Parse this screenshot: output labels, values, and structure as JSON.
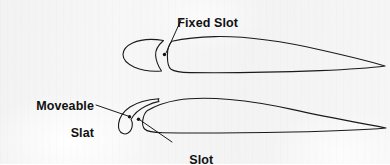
{
  "figure": {
    "background_color": "#f4f4f4",
    "ink_color": "#1a1a1a",
    "text_color": "#111111"
  },
  "labels": {
    "fixed_slot": "Fixed Slot",
    "moveable_slat_line1": "Moveable",
    "moveable_slat_line2": "Slat",
    "slot": "Slot"
  },
  "callouts": [
    {
      "name": "fixed-slot",
      "text": "Fixed Slot",
      "leader_from": [
        181,
        20
      ],
      "leader_to": [
        166,
        53
      ],
      "marker": [
        164,
        55
      ]
    },
    {
      "name": "moveable-slat",
      "text": "Moveable Slat",
      "leader_from": [
        96,
        105
      ],
      "leader_to": [
        128,
        116
      ],
      "marker": [
        130,
        117
      ]
    },
    {
      "name": "slot",
      "text": "Slot",
      "leader_from": [
        172,
        142
      ],
      "leader_to": [
        140,
        120
      ],
      "marker": [
        138,
        119
      ]
    }
  ],
  "diagrams": [
    {
      "name": "fixed-slot-airfoil",
      "description": "Upper airfoil with a fixed leading-edge slot formed by a separate forward wedge element",
      "chord_extent_px": [
        123,
        385
      ],
      "vertical_extent_px": [
        36,
        76
      ],
      "trailing_edge_px": [
        385,
        66
      ]
    },
    {
      "name": "moveable-slat-airfoil",
      "description": "Lower airfoil with an extended moveable slat forming a slot ahead of the leading edge",
      "chord_extent_px": [
        118,
        386
      ],
      "vertical_extent_px": [
        98,
        138
      ],
      "trailing_edge_px": [
        386,
        128
      ]
    }
  ]
}
